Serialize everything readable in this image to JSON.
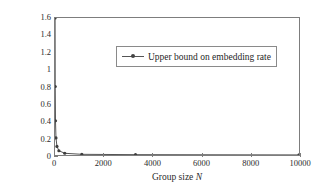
{
  "chart_data": {
    "type": "line",
    "title": "",
    "xlabel": "Group size N",
    "ylabel": "Embedding rate (bpp)",
    "xlim": [
      0,
      10000
    ],
    "ylim": [
      0,
      1.6
    ],
    "grid": false,
    "legend_position": "upper-center",
    "x_ticks": [
      0,
      2000,
      4000,
      6000,
      8000,
      10000
    ],
    "x_tick_labels": [
      "0",
      "2000",
      "4000",
      "6000",
      "8000",
      "10000"
    ],
    "y_ticks": [
      0,
      0.2,
      0.4,
      0.6,
      0.8,
      1,
      1.2,
      1.4,
      1.6
    ],
    "y_tick_labels": [
      "0",
      "0.2",
      "0.4",
      "0.6",
      "0.8",
      "1",
      "1.2",
      "1.4",
      "1.6"
    ],
    "series": [
      {
        "name": "Upper bound on embedding rate",
        "color": "#555555",
        "marker": "dot",
        "x": [
          4,
          10,
          20,
          40,
          80,
          160,
          400,
          1100,
          3300,
          10000
        ],
        "y": [
          1.6,
          0.8,
          0.4,
          0.2,
          0.1,
          0.05,
          0.02,
          0.008,
          0.004,
          0.001
        ]
      }
    ]
  },
  "legend": {
    "entries": [
      {
        "label": "Upper bound on embedding rate"
      }
    ]
  },
  "axes": {
    "x_title_prefix": "Group size ",
    "x_title_symbol": "N",
    "y_title": "Embedding rate (bpp)"
  }
}
